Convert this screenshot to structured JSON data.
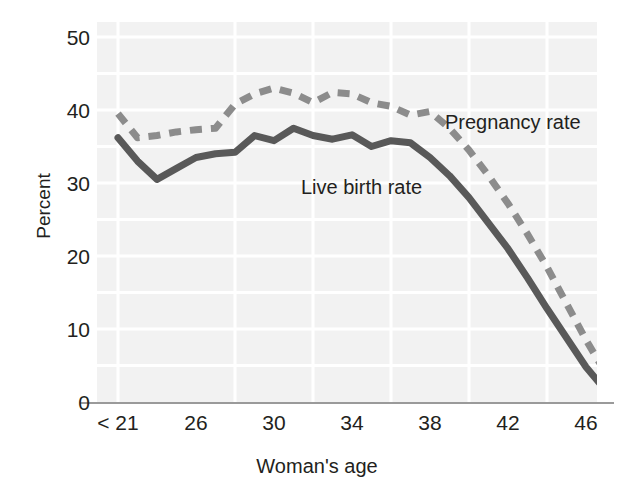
{
  "chart_data": {
    "type": "line",
    "title": "",
    "subtitle": "",
    "xlabel": "Woman's age",
    "ylabel": "Percent",
    "xlim": [
      20,
      46
    ],
    "ylim": [
      0,
      50
    ],
    "grid": true,
    "legend_position": "inline-annotations",
    "x_tick_labels": [
      "< 21",
      "26",
      "30",
      "34",
      "38",
      "42",
      "46"
    ],
    "x_tick_values": [
      20,
      26,
      30,
      34,
      38,
      42,
      46
    ],
    "y_tick_labels": [
      "50",
      "40",
      "30",
      "20",
      "10",
      "0"
    ],
    "y_tick_values": [
      50,
      40,
      30,
      20,
      10,
      0
    ],
    "x": [
      20,
      21,
      22,
      23,
      24,
      25,
      26,
      27,
      28,
      29,
      30,
      31,
      32,
      33,
      34,
      35,
      36,
      37,
      38,
      39,
      40,
      41,
      42,
      43,
      44,
      45,
      46
    ],
    "series": [
      {
        "name": "Pregnancy rate",
        "style": "dashed",
        "color": "#8c8c8c",
        "values": [
          39.5,
          36.2,
          36.5,
          37.0,
          37.3,
          37.5,
          40.8,
          42.2,
          43.0,
          42.3,
          41.0,
          42.4,
          42.2,
          41.0,
          40.5,
          39.3,
          39.8,
          37.5,
          34.5,
          31.0,
          27.2,
          23.0,
          18.5,
          13.5,
          8.5,
          4.0,
          1.2
        ]
      },
      {
        "name": "Live birth rate",
        "style": "solid",
        "color": "#595959",
        "values": [
          36.2,
          33.0,
          30.5,
          32.0,
          33.5,
          34.0,
          34.2,
          36.5,
          35.8,
          37.5,
          36.5,
          36.0,
          36.6,
          35.0,
          35.8,
          35.5,
          33.5,
          31.0,
          28.0,
          24.5,
          21.0,
          17.0,
          12.8,
          8.8,
          4.8,
          1.6,
          0.0
        ]
      }
    ],
    "annotations": [
      {
        "name": "pregnancy-rate-label",
        "text": "Pregnancy rate"
      },
      {
        "name": "live-birth-rate-label",
        "text": "Live birth rate"
      }
    ],
    "colors": {
      "plot_background": "#f2f2f2",
      "gridline": "#ffffff",
      "axis_line": "#9a9a9a",
      "text": "#231f20",
      "pregnancy_rate": "#8c8c8c",
      "live_birth_rate": "#595959"
    }
  },
  "axes": {
    "y_title": "Percent",
    "x_title": "Woman's age",
    "y_ticks": [
      {
        "label": "50",
        "top": 27
      },
      {
        "label": "40",
        "top": 100
      },
      {
        "label": "30",
        "top": 173
      },
      {
        "label": "20",
        "top": 246
      },
      {
        "label": "10",
        "top": 319
      },
      {
        "label": "0",
        "top": 392
      }
    ],
    "x_ticks": [
      {
        "label": "< 21",
        "left": 21
      },
      {
        "label": "26",
        "left": 99
      },
      {
        "label": "30",
        "left": 177
      },
      {
        "label": "34",
        "left": 255
      },
      {
        "label": "38",
        "left": 333
      },
      {
        "label": "42",
        "left": 411
      },
      {
        "label": "46",
        "left": 489
      }
    ]
  },
  "labels": {
    "pregnancy_rate": "Pregnancy rate",
    "live_birth_rate": "Live birth rate"
  }
}
